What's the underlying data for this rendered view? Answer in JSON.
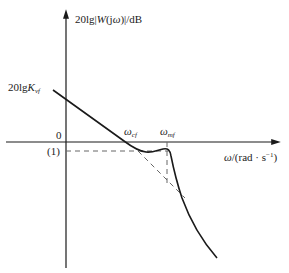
{
  "diagram": {
    "type": "bode-magnitude-plot",
    "y_axis_label_prefix": "20lg|",
    "y_axis_label_func": "W",
    "y_axis_label_arg": "(j",
    "y_axis_label_omega": "ω",
    "y_axis_label_suffix": ")|/dB",
    "x_axis_label_omega": "ω",
    "x_axis_label_unit": "/(rad · s",
    "x_axis_label_exp": "−1",
    "x_axis_label_close": ")",
    "intercept_label_prefix": "20lg",
    "intercept_label_var": "K",
    "intercept_label_sub": "vf",
    "origin_label": "0",
    "level_label": "(1)",
    "crossover_omega": "ω",
    "crossover_sub": "cf",
    "resonant_omega": "ω",
    "resonant_sub": "mf",
    "colors": {
      "line": "#1a1a1a",
      "dashed": "#666666"
    }
  }
}
